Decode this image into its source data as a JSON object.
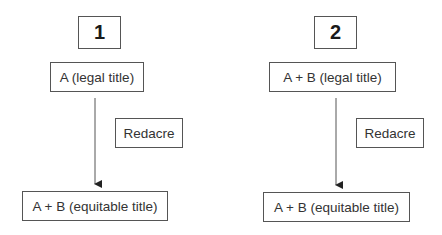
{
  "diagrams": [
    {
      "number": "1",
      "top_box": "A (legal title)",
      "side_box": "Redacre",
      "bottom_box": "A + B (equitable title)"
    },
    {
      "number": "2",
      "top_box": "A + B (legal title)",
      "side_box": "Redacre",
      "bottom_box": "A + B (equitable title)"
    }
  ],
  "colors": {
    "border": "#555555",
    "text": "#333333",
    "arrow": "#333333"
  }
}
